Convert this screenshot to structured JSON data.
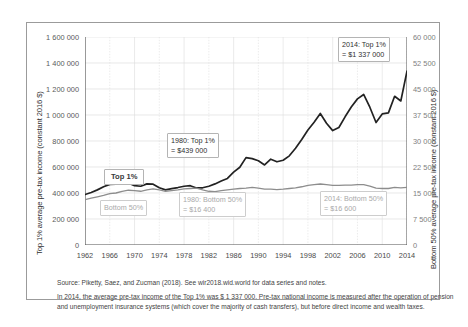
{
  "axes": {
    "left_title": "Top 1% average pre-tax income (constant 2016 $)",
    "right_title": "Bottom 50% average pre-tax income (constant 2016 $)"
  },
  "annotations": {
    "top1_label": "Top 1%",
    "bottom50_label": "Bottom 50%",
    "top1_1980": "1980: Top 1%\n= $439 000",
    "top1_2014": "2014: Top 1%\n= $1 337 000",
    "bottom50_1980": "1980: Bottom 50%\n= $16 400",
    "bottom50_2014": "2014: Bottom 50%\n= $16 600"
  },
  "footer": {
    "source": "Source: Piketty, Saez, and Zucman (2018). See wir2018.wid.world for data series and notes.",
    "note": "In 2014, the average pre-tax income of the Top 1% was $ 1 337 000. Pre-tax national income is measured after the operation of pension and unemployment insurance systems (which cover the majority of cash transfers), but before direct income and wealth taxes."
  },
  "chart_data": {
    "type": "line",
    "title": "",
    "xlabel": "",
    "ylabel": "Top 1% average pre-tax income (constant 2016 $)",
    "y2label": "Bottom 50% average pre-tax income (constant 2016 $)",
    "xlim": [
      1962,
      2014
    ],
    "ylim": [
      0,
      1600000
    ],
    "y2lim": [
      0,
      60000
    ],
    "xticks": [
      1962,
      1966,
      1970,
      1974,
      1978,
      1982,
      1986,
      1990,
      1994,
      1998,
      2002,
      2006,
      2010,
      2014
    ],
    "yticks": [
      0,
      200000,
      400000,
      600000,
      800000,
      1000000,
      1200000,
      1400000,
      1600000
    ],
    "yticklabels": [
      "0",
      "200 000",
      "400 000",
      "600 000",
      "800 000",
      "1 000 000",
      "1 200 000",
      "1 400 000",
      "1 600 000"
    ],
    "y2ticks": [
      0,
      7500,
      15000,
      22500,
      30000,
      37500,
      45000,
      52500,
      60000
    ],
    "y2ticklabels": [
      "0",
      "7 500",
      "15 000",
      "22 500",
      "30 000",
      "37 500",
      "45 000",
      "52 500",
      "60 000"
    ],
    "grid": true,
    "legend": "inline-labels",
    "x": [
      1962,
      1963,
      1964,
      1965,
      1966,
      1967,
      1968,
      1969,
      1970,
      1971,
      1972,
      1973,
      1974,
      1975,
      1976,
      1977,
      1978,
      1979,
      1980,
      1981,
      1982,
      1983,
      1984,
      1985,
      1986,
      1987,
      1988,
      1989,
      1990,
      1991,
      1992,
      1993,
      1994,
      1995,
      1996,
      1997,
      1998,
      1999,
      2000,
      2001,
      2002,
      2003,
      2004,
      2005,
      2006,
      2007,
      2008,
      2009,
      2010,
      2011,
      2012,
      2013,
      2014
    ],
    "series": [
      {
        "name": "Top 1%",
        "axis": "left",
        "color": "#222222",
        "values": [
          388000,
          404000,
          424000,
          448000,
          466000,
          468000,
          482000,
          478000,
          456000,
          452000,
          470000,
          468000,
          440000,
          424000,
          434000,
          442000,
          452000,
          456000,
          439000,
          440000,
          452000,
          470000,
          492000,
          512000,
          560000,
          598000,
          672000,
          664000,
          648000,
          616000,
          660000,
          640000,
          652000,
          686000,
          744000,
          812000,
          884000,
          944000,
          1012000,
          936000,
          880000,
          904000,
          986000,
          1062000,
          1124000,
          1158000,
          1060000,
          942000,
          1008000,
          1016000,
          1144000,
          1108000,
          1337000
        ]
      },
      {
        "name": "Bottom 50%",
        "axis": "right",
        "color": "#8d8d8d",
        "values": [
          13100,
          13500,
          13900,
          14300,
          14800,
          15000,
          15500,
          15800,
          15700,
          15500,
          15900,
          16200,
          15900,
          15500,
          15700,
          15900,
          16200,
          16300,
          16400,
          15900,
          15500,
          15400,
          15700,
          15900,
          16100,
          16300,
          16400,
          16600,
          16400,
          16100,
          16100,
          16000,
          16100,
          16300,
          16500,
          16800,
          17200,
          17400,
          17600,
          17400,
          17200,
          17200,
          17300,
          17300,
          17400,
          17400,
          17000,
          16400,
          16300,
          16300,
          16600,
          16500,
          16600
        ]
      }
    ],
    "callouts": [
      {
        "label": "1980: Top 1% = $439 000",
        "x": 1980,
        "y": 439000,
        "series": "Top 1%"
      },
      {
        "label": "2014: Top 1% = $1 337 000",
        "x": 2014,
        "y": 1337000,
        "series": "Top 1%"
      },
      {
        "label": "1980: Bottom 50% = $16 400",
        "x": 1980,
        "y": 16400,
        "series": "Bottom 50%"
      },
      {
        "label": "2014: Bottom 50% = $16 600",
        "x": 2014,
        "y": 16600,
        "series": "Bottom 50%"
      }
    ]
  }
}
